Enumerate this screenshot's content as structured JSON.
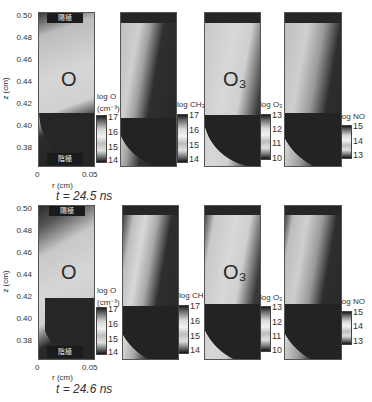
{
  "figure": {
    "rows": [
      {
        "time_label": "t = 24.5 ns",
        "panels": [
          {
            "species": "O",
            "label": "O",
            "colorbar_title": "log O",
            "colorbar_unit": "(cm⁻³)",
            "ticks": [
              "17",
              "16",
              "15",
              "14"
            ]
          },
          {
            "species": "CH3",
            "label": "",
            "colorbar_title": "log CH₃",
            "colorbar_unit": "",
            "ticks": [
              "17",
              "16",
              "15",
              "14"
            ]
          },
          {
            "species": "O3",
            "label": "O₃",
            "colorbar_title": "log O₃",
            "colorbar_unit": "",
            "ticks": [
              "13",
              "12",
              "11",
              "10"
            ]
          },
          {
            "species": "NO",
            "label": "",
            "colorbar_title": "log NO",
            "colorbar_unit": "",
            "ticks": [
              "15",
              "14",
              "13"
            ]
          }
        ]
      },
      {
        "time_label": "t = 24.6 ns",
        "panels": [
          {
            "species": "O",
            "label": "O",
            "colorbar_title": "log O",
            "colorbar_unit": "(cm⁻³)",
            "ticks": [
              "17",
              "16",
              "15",
              "14"
            ]
          },
          {
            "species": "CH3",
            "label": "",
            "colorbar_title": "log CH₃",
            "colorbar_unit": "",
            "ticks": [
              "17",
              "16",
              "15",
              "14"
            ]
          },
          {
            "species": "O3",
            "label": "O₃",
            "colorbar_title": "log O₃",
            "colorbar_unit": "",
            "ticks": [
              "13",
              "12",
              "11",
              "10"
            ]
          },
          {
            "species": "NO",
            "label": "",
            "colorbar_title": "log NO",
            "colorbar_unit": "",
            "ticks": [
              "15",
              "14",
              "13"
            ]
          }
        ]
      }
    ],
    "y_axis": {
      "title": "z (cm)",
      "ticks": [
        "0.50",
        "0.48",
        "0.46",
        "0.44",
        "0.42",
        "0.40",
        "0.38"
      ]
    },
    "x_axis": {
      "title": "r (cm)",
      "ticks": [
        "0",
        "0.05"
      ]
    },
    "electrodes": {
      "top": "陽極",
      "bottom": "陰極"
    }
  }
}
